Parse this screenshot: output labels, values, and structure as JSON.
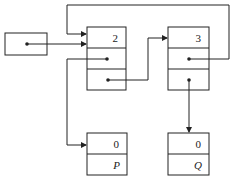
{
  "diagram": {
    "type": "linked-list-pointer-diagram",
    "nodes": [
      {
        "id": "head",
        "label": "",
        "cells": 1
      },
      {
        "id": "node1",
        "value": "2",
        "cells": 3
      },
      {
        "id": "node2",
        "value": "3",
        "cells": 3
      },
      {
        "id": "P",
        "value": "0",
        "name": "P",
        "cells": 2
      },
      {
        "id": "Q",
        "value": "0",
        "name": "Q",
        "cells": 2
      }
    ],
    "edges": [
      {
        "from": "head",
        "to": "node1"
      },
      {
        "from": "node1.cell2",
        "to": "P"
      },
      {
        "from": "node1.cell3",
        "to": "node2"
      },
      {
        "from": "node2.cell2",
        "to": "node1"
      },
      {
        "from": "node2.cell3",
        "to": "Q"
      }
    ]
  },
  "labels": {
    "node1_value": "2",
    "node2_value": "3",
    "p_value": "0",
    "p_name": "P",
    "q_value": "0",
    "q_name": "Q"
  },
  "colors": {
    "stroke": "#222222",
    "background": "#ffffff"
  }
}
